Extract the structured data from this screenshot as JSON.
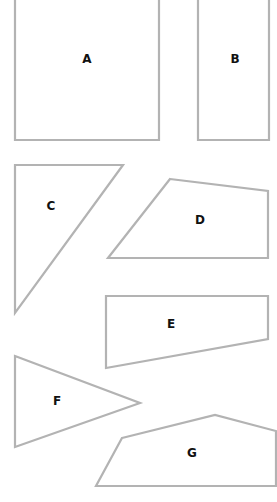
{
  "diagram": {
    "stroke_color": "#b3b3b3",
    "label_color": "#111111",
    "background": "#ffffff",
    "shapes": [
      {
        "id": "A",
        "label": "A",
        "type": "rectangle",
        "points": "15,-5 159,-5 159,140 15,140",
        "label_pos": [
          87,
          59
        ]
      },
      {
        "id": "B",
        "label": "B",
        "type": "rectangle",
        "points": "198,-5 269,-5 269,140 198,140",
        "label_pos": [
          235,
          59
        ]
      },
      {
        "id": "C",
        "label": "C",
        "type": "triangle",
        "points": "15,165 123,165 15,313",
        "label_pos": [
          51,
          206
        ]
      },
      {
        "id": "D",
        "label": "D",
        "type": "quadrilateral",
        "points": "170,179 268,191 268,258 108,258",
        "label_pos": [
          200,
          220
        ]
      },
      {
        "id": "E",
        "label": "E",
        "type": "quadrilateral",
        "points": "106,296 268,296 268,339 106,368",
        "label_pos": [
          171,
          324
        ]
      },
      {
        "id": "F",
        "label": "F",
        "type": "triangle",
        "points": "15,356 140,403 15,447",
        "label_pos": [
          57,
          401
        ]
      },
      {
        "id": "G",
        "label": "G",
        "type": "pentagon",
        "points": "122,438 215,415 276,431 276,486 96,486",
        "label_pos": [
          192,
          453
        ]
      }
    ]
  }
}
